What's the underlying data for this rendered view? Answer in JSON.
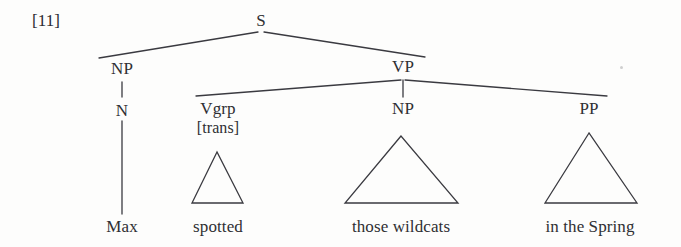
{
  "figure": {
    "index_label": "[11]",
    "caption": "",
    "line_color": "#3a3a40",
    "text_color": "#2f2f33",
    "background": "#fdfdfc"
  },
  "tree": {
    "type": "constituency-syntax-tree",
    "sentence": "Max spotted those wildcats in the Spring",
    "root": "S",
    "nodes": [
      {
        "id": "S",
        "label": "S",
        "x": 261,
        "y": 22,
        "kind": "nonterminal"
      },
      {
        "id": "NP1",
        "label": "NP",
        "x": 122,
        "y": 70,
        "kind": "nonterminal"
      },
      {
        "id": "N",
        "label": "N",
        "x": 122,
        "y": 112,
        "kind": "nonterminal"
      },
      {
        "id": "VP",
        "label": "VP",
        "x": 403,
        "y": 68,
        "kind": "nonterminal"
      },
      {
        "id": "Vgrp",
        "label": "Vgrp",
        "x": 218,
        "y": 110,
        "kind": "nonterminal"
      },
      {
        "id": "trans",
        "label": "[trans]",
        "x": 218,
        "y": 130,
        "kind": "feature"
      },
      {
        "id": "NP2",
        "label": "NP",
        "x": 403,
        "y": 110,
        "kind": "nonterminal"
      },
      {
        "id": "PP",
        "label": "PP",
        "x": 589,
        "y": 110,
        "kind": "nonterminal"
      }
    ],
    "leaves": [
      {
        "id": "leaf-max",
        "label": "Max",
        "x": 122,
        "y": 230
      },
      {
        "id": "leaf-spotted",
        "label": "spotted",
        "x": 218,
        "y": 230
      },
      {
        "id": "leaf-wildcats",
        "label": "those wildcats",
        "x": 401,
        "y": 230
      },
      {
        "id": "leaf-spring",
        "label": "in the Spring",
        "x": 590,
        "y": 230
      }
    ],
    "edges": [
      {
        "from": "S",
        "to": "NP1",
        "kind": "branch"
      },
      {
        "from": "S",
        "to": "VP",
        "kind": "branch"
      },
      {
        "from": "NP1",
        "to": "N",
        "kind": "stem"
      },
      {
        "from": "N",
        "to": "leaf-max",
        "kind": "stem"
      },
      {
        "from": "VP",
        "to": "Vgrp",
        "kind": "branch"
      },
      {
        "from": "VP",
        "to": "NP2",
        "kind": "stem"
      },
      {
        "from": "VP",
        "to": "PP",
        "kind": "branch"
      }
    ],
    "triangles": [
      {
        "id": "tri-spotted",
        "node": "Vgrp",
        "apex_x": 217,
        "apex_y": 152,
        "left_x": 192,
        "right_x": 243,
        "base_y": 203
      },
      {
        "id": "tri-wildcats",
        "node": "NP2",
        "apex_x": 401,
        "apex_y": 136,
        "left_x": 345,
        "right_x": 458,
        "base_y": 203
      },
      {
        "id": "tri-spring",
        "node": "PP",
        "apex_x": 589,
        "apex_y": 133,
        "left_x": 545,
        "right_x": 637,
        "base_y": 203
      }
    ]
  }
}
